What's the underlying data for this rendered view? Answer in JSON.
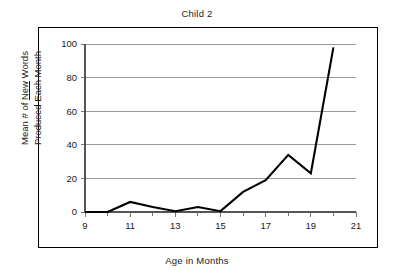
{
  "chart_data": {
    "type": "line",
    "title": "Child 2",
    "xlabel": "Age in Months",
    "ylabel_line1": "Mean # of New Words",
    "ylabel_line1_a": "Mean # of ",
    "ylabel_line1_underlined": "New",
    "ylabel_line1_b": " Words",
    "ylabel_line2": "Produced Each Month",
    "x": [
      9,
      10,
      11,
      12,
      13,
      14,
      15,
      16,
      17,
      18,
      19,
      20
    ],
    "values": [
      0,
      0,
      6,
      3,
      0.5,
      3,
      0.5,
      12,
      19,
      34,
      23,
      98
    ],
    "series": [
      {
        "name": "Child 2",
        "values": [
          0,
          0,
          6,
          3,
          0.5,
          3,
          0.5,
          12,
          19,
          34,
          23,
          98
        ]
      }
    ],
    "xlim": [
      9,
      21
    ],
    "ylim": [
      0,
      100
    ],
    "x_major_ticks": [
      9,
      11,
      13,
      15,
      17,
      19,
      21
    ],
    "x_minor_ticks": [
      10,
      12,
      14,
      16,
      18,
      20
    ],
    "xtick_labels": [
      "9",
      "11",
      "13",
      "15",
      "17",
      "19",
      "21"
    ],
    "ytick_values": [
      0,
      20,
      40,
      60,
      80,
      100
    ],
    "ytick_labels": [
      "0",
      "20",
      "40",
      "60",
      "80",
      "100"
    ],
    "grid": "horizontal",
    "legend": "none",
    "line_color": "#000000",
    "grid_color": "#808080",
    "frame_color": "#000000",
    "background": "#ffffff"
  }
}
